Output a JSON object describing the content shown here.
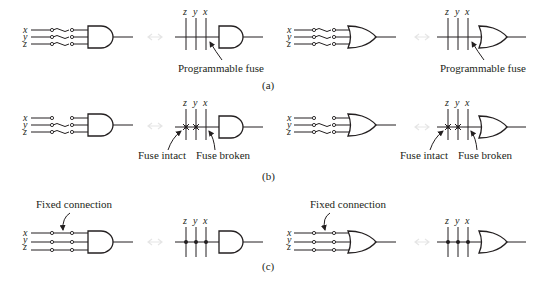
{
  "figure": {
    "rows": [
      {
        "id": "a",
        "caption": "(a)",
        "left_and": {
          "inputs": [
            "x",
            "y",
            "z"
          ],
          "gate": "AND",
          "connection": "fuse"
        },
        "right_and": {
          "inputs": [
            "z",
            "y",
            "x"
          ],
          "gate": "AND",
          "annotation": "Programmable fuse"
        },
        "left_or": {
          "inputs": [
            "x",
            "y",
            "z"
          ],
          "gate": "OR",
          "connection": "fuse"
        },
        "right_or": {
          "inputs": [
            "z",
            "y",
            "x"
          ],
          "gate": "OR",
          "annotation": "Programmable fuse"
        }
      },
      {
        "id": "b",
        "caption": "(b)",
        "left_and": {
          "inputs": [
            "x",
            "y",
            "z"
          ],
          "gate": "AND",
          "connection": "fuse-partial"
        },
        "right_and": {
          "inputs": [
            "z",
            "y",
            "x"
          ],
          "gate": "AND",
          "annotation_left": "Fuse intact",
          "annotation_right": "Fuse broken"
        },
        "left_or": {
          "inputs": [
            "x",
            "y",
            "z"
          ],
          "gate": "OR",
          "connection": "fuse-partial"
        },
        "right_or": {
          "inputs": [
            "z",
            "y",
            "x"
          ],
          "gate": "OR",
          "annotation_left": "Fuse intact",
          "annotation_right": "Fuse broken"
        }
      },
      {
        "id": "c",
        "caption": "(c)",
        "left_and": {
          "inputs": [
            "x",
            "y",
            "z"
          ],
          "gate": "AND",
          "annotation": "Fixed connection"
        },
        "right_and": {
          "inputs": [
            "z",
            "y",
            "x"
          ],
          "gate": "AND",
          "connection": "fixed"
        },
        "left_or": {
          "inputs": [
            "x",
            "y",
            "z"
          ],
          "gate": "OR",
          "annotation": "Fixed connection"
        },
        "right_or": {
          "inputs": [
            "z",
            "y",
            "x"
          ],
          "gate": "OR",
          "connection": "fixed"
        }
      }
    ]
  }
}
